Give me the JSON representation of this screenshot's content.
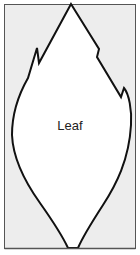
{
  "diagram": {
    "label": "Leaf",
    "colors": {
      "background": "#ededed",
      "leaf_fill": "#ffffff",
      "outline": "#111111",
      "frame": "#555555"
    }
  }
}
